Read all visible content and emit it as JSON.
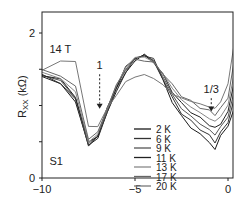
{
  "chart_data": {
    "type": "line",
    "title": "",
    "xlabel": "",
    "ylabel": "Rxx (kΩ)",
    "ylabel_main": "R",
    "ylabel_sub": "XX",
    "ylabel_unit": " (kΩ)",
    "xlim": [
      -10,
      0.6
    ],
    "ylim": [
      0,
      2.25
    ],
    "x_ticks": [
      -10,
      -5,
      0
    ],
    "x_tick_labels": [
      "−10",
      "−5",
      "0"
    ],
    "y_ticks": [
      0,
      0.5,
      1,
      1.5,
      2
    ],
    "y_tick_labels": [
      "0",
      "",
      "",
      "",
      "2"
    ],
    "grid": false,
    "legend_position": "lower center-right",
    "annotations": [
      {
        "text": "14 T",
        "x": -9.6,
        "y": 1.72
      },
      {
        "text": "S1",
        "x": -9.6,
        "y": 0.18
      },
      {
        "text": "1",
        "x": -6.9,
        "y": 1.5,
        "arrow_to_y": 0.97
      },
      {
        "text": "1/3",
        "x": -0.9,
        "y": 1.17,
        "arrow_to_y": 0.93
      }
    ],
    "x": [
      -10,
      -9,
      -8.2,
      -7.5,
      -7,
      -6.5,
      -6,
      -5.5,
      -5,
      -4.5,
      -4,
      -3.5,
      -3,
      -2.5,
      -2,
      -1.5,
      -1,
      -0.7,
      -0.4,
      0,
      0.3,
      0.5
    ],
    "series": [
      {
        "name": "2 K",
        "color": "#1a1a1a",
        "values": [
          1.4,
          1.3,
          1.05,
          0.45,
          0.55,
          0.9,
          1.2,
          1.45,
          1.62,
          1.7,
          1.62,
          1.35,
          1.05,
          0.85,
          0.7,
          0.6,
          0.5,
          0.38,
          0.6,
          0.7,
          0.95,
          1.2
        ]
      },
      {
        "name": "6 K",
        "color": "#333333",
        "values": [
          1.41,
          1.32,
          1.07,
          0.46,
          0.56,
          0.92,
          1.22,
          1.47,
          1.64,
          1.7,
          1.63,
          1.38,
          1.1,
          0.9,
          0.78,
          0.68,
          0.58,
          0.5,
          0.62,
          0.78,
          1.05,
          1.3
        ]
      },
      {
        "name": "9 K",
        "color": "#555555",
        "values": [
          1.42,
          1.34,
          1.1,
          0.47,
          0.58,
          0.93,
          1.25,
          1.5,
          1.65,
          1.69,
          1.62,
          1.4,
          1.15,
          0.96,
          0.85,
          0.75,
          0.66,
          0.6,
          0.7,
          0.85,
          1.15,
          1.45
        ]
      },
      {
        "name": "11 K",
        "color": "#222222",
        "values": [
          1.43,
          1.35,
          1.13,
          0.48,
          0.59,
          0.95,
          1.26,
          1.52,
          1.66,
          1.68,
          1.61,
          1.42,
          1.2,
          1.02,
          0.92,
          0.82,
          0.74,
          0.68,
          0.76,
          0.9,
          1.3,
          1.7
        ]
      },
      {
        "name": "13 K",
        "color": "#888888",
        "values": [
          1.45,
          1.38,
          1.18,
          0.5,
          0.6,
          0.96,
          1.27,
          1.53,
          1.66,
          1.67,
          1.6,
          1.44,
          1.24,
          1.08,
          0.98,
          0.9,
          0.82,
          0.78,
          0.85,
          1.0,
          1.4,
          1.9
        ]
      },
      {
        "name": "17 K",
        "color": "#666666",
        "values": [
          1.48,
          1.42,
          1.25,
          0.55,
          0.62,
          0.97,
          1.27,
          1.5,
          1.62,
          1.63,
          1.58,
          1.45,
          1.28,
          1.14,
          1.05,
          0.98,
          0.92,
          0.88,
          0.95,
          1.12,
          1.55,
          2.05
        ]
      },
      {
        "name": "20 K",
        "color": "#777777",
        "values": [
          1.5,
          1.6,
          1.62,
          0.7,
          0.72,
          0.95,
          1.15,
          1.32,
          1.4,
          1.42,
          1.38,
          1.28,
          1.16,
          1.1,
          1.06,
          1.02,
          0.98,
          0.96,
          1.05,
          1.3,
          1.8,
          2.2
        ]
      }
    ]
  }
}
